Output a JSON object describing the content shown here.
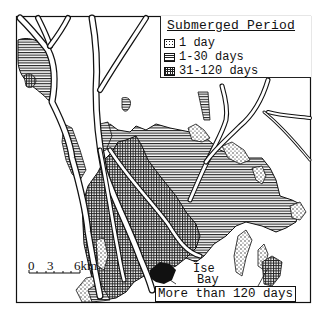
{
  "legend": {
    "title": "Submerged Period",
    "items": [
      {
        "pattern": "dotted",
        "label": "1 day"
      },
      {
        "pattern": "horizontal-lines",
        "label": "1-30 days"
      },
      {
        "pattern": "grid",
        "label": "31-120 days"
      }
    ]
  },
  "scale_bar": {
    "ticks": [
      "0",
      "3",
      "6km"
    ]
  },
  "annotations": {
    "bay_label_line1": "Ise",
    "bay_label_line2": "Bay",
    "longest_callout": "More than 120 days"
  },
  "colors": {
    "ink": "#111111",
    "paper": "#ffffff"
  }
}
